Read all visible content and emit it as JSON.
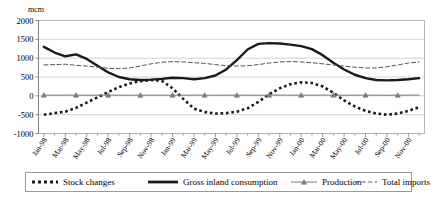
{
  "chart_data": {
    "type": "line",
    "title": "",
    "unit_label": "mcm",
    "xlabel": "",
    "ylabel": "",
    "ylim": [
      -1000,
      2000
    ],
    "ytick_step": 500,
    "yticks": [
      2000,
      1500,
      1000,
      500,
      0,
      -500,
      -1000
    ],
    "ytick_labels": [
      "2000",
      "1500",
      "1000",
      "500",
      "0",
      "-500",
      "-1000"
    ],
    "grid": true,
    "grid_axis": "y",
    "legend_position": "bottom",
    "x": [
      "Jan-98",
      "Feb-98",
      "Mar-98",
      "Apr-98",
      "May-98",
      "Jun-98",
      "Jul-98",
      "Aug-98",
      "Sep-98",
      "Oct-98",
      "Nov-98",
      "Dec-98",
      "Jan-99",
      "Feb-99",
      "Mar-99",
      "Apr-99",
      "May-99",
      "Jun-99",
      "Jul-99",
      "Aug-99",
      "Sep-99",
      "Oct-99",
      "Nov-99",
      "Dec-99",
      "Jan-00",
      "Feb-00",
      "Mar-00",
      "Apr-00",
      "May-00",
      "Jun-00",
      "Jul-00",
      "Aug-00",
      "Sep-00",
      "Oct-00",
      "Nov-00",
      "Dec-00"
    ],
    "xtick_labels": [
      "Jan-98",
      "Mar-98",
      "May-98",
      "Jul-98",
      "Sep-98",
      "Nov-98",
      "Jan-99",
      "Mar-99",
      "May-99",
      "Jul-99",
      "Sep-99",
      "Nov-99",
      "Jan-00",
      "Mar-00",
      "May-00",
      "Jul-00",
      "Sep-00",
      "Nov-00"
    ],
    "xtick_indices": [
      0,
      2,
      4,
      6,
      8,
      10,
      12,
      14,
      16,
      18,
      20,
      22,
      24,
      26,
      28,
      30,
      32,
      34
    ],
    "series": [
      {
        "name": "Stock changes",
        "style": "thick-dotted",
        "color": "#1a1a1a",
        "values": [
          -500,
          -460,
          -420,
          -320,
          -180,
          -40,
          100,
          230,
          330,
          390,
          420,
          400,
          200,
          -80,
          -340,
          -430,
          -470,
          -460,
          -420,
          -330,
          -160,
          40,
          200,
          310,
          360,
          340,
          250,
          80,
          -120,
          -280,
          -400,
          -470,
          -500,
          -470,
          -400,
          -300
        ]
      },
      {
        "name": "Gross inland consumption",
        "style": "thick-solid",
        "color": "#1a1a1a",
        "values": [
          1300,
          1150,
          1050,
          1100,
          980,
          800,
          620,
          500,
          440,
          420,
          430,
          450,
          480,
          470,
          440,
          470,
          540,
          700,
          950,
          1230,
          1380,
          1400,
          1390,
          1360,
          1320,
          1240,
          1080,
          880,
          700,
          560,
          470,
          420,
          410,
          420,
          440,
          470
        ]
      },
      {
        "name": "Production",
        "style": "thin-marker",
        "color": "#7a7a7a",
        "marker": "triangle",
        "values": [
          20,
          18,
          20,
          18,
          16,
          18,
          20,
          18,
          16,
          18,
          20,
          18,
          20,
          18,
          20,
          18,
          16,
          18,
          20,
          18,
          16,
          18,
          20,
          18,
          20,
          18,
          20,
          18,
          16,
          18,
          20,
          18,
          16,
          18,
          20,
          18
        ]
      },
      {
        "name": "Total imports",
        "style": "thin-dashed",
        "color": "#555555",
        "values": [
          820,
          830,
          840,
          810,
          790,
          760,
          730,
          720,
          740,
          790,
          850,
          890,
          910,
          900,
          880,
          860,
          830,
          800,
          790,
          800,
          830,
          870,
          900,
          910,
          900,
          880,
          850,
          820,
          790,
          760,
          740,
          740,
          770,
          820,
          870,
          900
        ]
      }
    ],
    "winter_peaks": {
      "1999-01": 1400,
      "2000-01": 1500,
      "2000-12": 1250
    }
  },
  "legend": {
    "items": [
      {
        "label": "Stock changes",
        "style": "thick-dotted"
      },
      {
        "label": "Gross inland consumption",
        "style": "thick-solid"
      },
      {
        "label": "Production",
        "style": "thin-marker"
      },
      {
        "label": "Total imports",
        "style": "thin-dashed"
      }
    ]
  }
}
